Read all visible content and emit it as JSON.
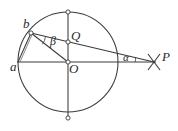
{
  "figure": {
    "background_color": "#ffffff",
    "stroke_color": "#3a3a3a",
    "label_color": "#2b2b2b",
    "width": 178,
    "height": 131
  },
  "circle": {
    "center_label": "O",
    "center_x": 68,
    "center_y": 62,
    "radius": 50
  },
  "points": [
    {
      "id": "a",
      "label": "a",
      "x": 18,
      "y": 62,
      "marker": "none",
      "description": "left end of horizontal diameter on circle"
    },
    {
      "id": "b",
      "label": "b",
      "x": 31,
      "y": 33,
      "marker": "dot",
      "description": "point on circle upper left"
    },
    {
      "id": "O",
      "label": "O",
      "x": 68,
      "y": 62,
      "marker": "dot",
      "description": "center of circle"
    },
    {
      "id": "Q",
      "label": "Q",
      "x": 68,
      "y": 42,
      "marker": "dot",
      "description": "intersection of chord bP with vertical diameter"
    },
    {
      "id": "top",
      "label": "",
      "x": 68,
      "y": 12,
      "marker": "dot",
      "description": "top of vertical diameter"
    },
    {
      "id": "bottom",
      "label": "",
      "x": 68,
      "y": 118,
      "marker": "dot",
      "description": "bottom of vertical diameter"
    },
    {
      "id": "right",
      "label": "",
      "x": 118,
      "y": 62,
      "marker": "none",
      "description": "right end of horizontal diameter on circle"
    },
    {
      "id": "P",
      "label": "P",
      "x": 155,
      "y": 62,
      "marker": "cross",
      "description": "external point right of circle marked with an X"
    }
  ],
  "angles": [
    {
      "id": "alpha",
      "label": "α",
      "vertex": "P",
      "marker": "arc",
      "description": "angle at external point P between line bP and horizontal axis"
    },
    {
      "id": "beta",
      "label": "β",
      "vertex": "b",
      "marker": "arc",
      "description": "angle at b between chord bP and segment bO"
    }
  ],
  "segments": [
    {
      "id": "horizontal-diameter",
      "from": "a",
      "to": "P",
      "style": "solid",
      "description": "horizontal diameter extended through O to P"
    },
    {
      "id": "vertical-diameter",
      "from": "top",
      "to": "bottom",
      "style": "solid",
      "description": "vertical diameter through O"
    },
    {
      "id": "chord-b-P",
      "from": "b",
      "to": "P",
      "style": "solid",
      "description": "line from b through Q to external point P"
    },
    {
      "id": "segment-b-O",
      "from": "b",
      "to": "O",
      "style": "solid",
      "description": "radius from b to center O"
    },
    {
      "id": "chord-a-b",
      "from": "a",
      "to": "b",
      "style": "solid",
      "description": "short chord joining a and b"
    }
  ],
  "labels": {
    "a": "a",
    "b": "b",
    "O": "O",
    "Q": "Q",
    "P": "P",
    "alpha": "α",
    "beta": "β"
  }
}
